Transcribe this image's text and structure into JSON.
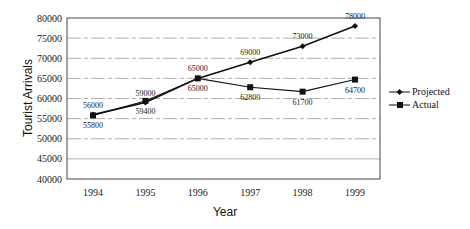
{
  "chart_data": {
    "type": "line",
    "title": "",
    "xlabel": "Year",
    "ylabel": "Tourist Arrivals",
    "categories": [
      "1994",
      "1995",
      "1996",
      "1997",
      "1998",
      "1999"
    ],
    "y_ticks": [
      "40000",
      "45000",
      "50000",
      "55000",
      "60000",
      "65000",
      "70000",
      "75000",
      "80000"
    ],
    "ylim": [
      40000,
      80000
    ],
    "grid": "horizontal dashed",
    "legend_position": "right",
    "series": [
      {
        "name": "Projected",
        "marker": "diamond",
        "values": [
          56000,
          59000,
          65000,
          69000,
          73000,
          78000
        ],
        "labels": [
          "56000",
          "59000",
          "65000",
          "69000",
          "73000",
          "78000"
        ]
      },
      {
        "name": "Actual",
        "marker": "square",
        "values": [
          55800,
          59400,
          65000,
          62800,
          61700,
          64700
        ],
        "labels": [
          "55800",
          "59400",
          "65000",
          "62800",
          "61700",
          "64700"
        ]
      }
    ]
  }
}
